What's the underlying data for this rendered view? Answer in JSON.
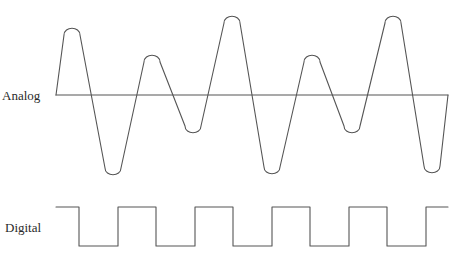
{
  "diagram": {
    "labels": {
      "analog": "Analog",
      "digital": "Digital"
    },
    "colors": {
      "line": "#555555",
      "text": "#2a2a2a",
      "background": "#ffffff"
    },
    "analog_signal": {
      "baseline_y": 95,
      "x_start": 56,
      "x_end": 448,
      "extrema": [
        {
          "type": "peak",
          "x": 72,
          "y": 27
        },
        {
          "type": "trough",
          "x": 113,
          "y": 176
        },
        {
          "type": "peak",
          "x": 152,
          "y": 54
        },
        {
          "type": "trough",
          "x": 193,
          "y": 134
        },
        {
          "type": "peak",
          "x": 232,
          "y": 15
        },
        {
          "type": "trough",
          "x": 272,
          "y": 175
        },
        {
          "type": "peak",
          "x": 312,
          "y": 54
        },
        {
          "type": "trough",
          "x": 352,
          "y": 134
        },
        {
          "type": "peak",
          "x": 393,
          "y": 15
        },
        {
          "type": "trough",
          "x": 432,
          "y": 174
        }
      ]
    },
    "digital_signal": {
      "high_y": 207,
      "low_y": 246,
      "x_start": 56,
      "x_end": 448,
      "pulses": [
        {
          "x1": 79,
          "x2": 118
        },
        {
          "x1": 156,
          "x2": 195
        },
        {
          "x1": 233,
          "x2": 272
        },
        {
          "x1": 310,
          "x2": 349
        },
        {
          "x1": 387,
          "x2": 426
        }
      ]
    }
  }
}
